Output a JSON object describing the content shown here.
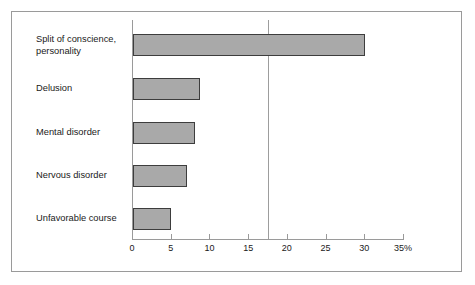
{
  "chart_data": {
    "type": "bar",
    "orientation": "horizontal",
    "title": "",
    "subtitle": "",
    "xlabel": "",
    "ylabel": "",
    "categories": [
      "Split of conscience, personality",
      "Delusion",
      "Mental disorder",
      "Nervous disorder",
      "Unfavorable course"
    ],
    "values": [
      30,
      8.7,
      8,
      7,
      4.9
    ],
    "xlim": [
      0,
      35
    ],
    "xticks": [
      0,
      5,
      10,
      15,
      20,
      25,
      35
    ],
    "xtick_labels": [
      "0",
      "5",
      "10",
      "15",
      "20",
      "25",
      "30",
      "35%"
    ],
    "xtick_values": [
      0,
      5,
      10,
      15,
      20,
      25,
      30,
      35
    ],
    "grid": false,
    "legend": null,
    "annotations": [
      {
        "type": "reference-line",
        "orientation": "vertical",
        "value": 17.5,
        "label": ""
      }
    ],
    "unit": "%",
    "colors": {
      "bar_fill": "#a9a9a9",
      "bar_border": "#3d3d3d",
      "axis": "#9a9a9a",
      "reference_line": "#9d9d9d",
      "frame": "#9a9a9a",
      "text": "#1a1a1a",
      "background": "#ffffff"
    }
  }
}
